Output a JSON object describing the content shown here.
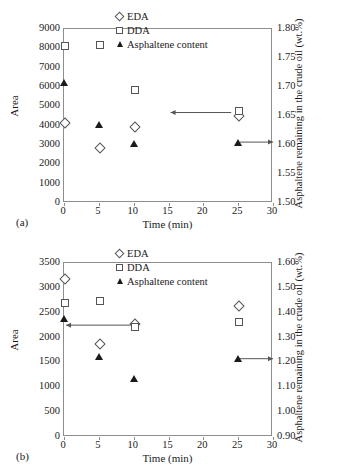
{
  "figure": {
    "panels": [
      {
        "panel_label": "(a)",
        "legend": [
          {
            "symbol": "diamond-open",
            "label": "EDA"
          },
          {
            "symbol": "square-open",
            "label": "DDA"
          },
          {
            "symbol": "triangle-filled",
            "label": "Asphaltene content"
          }
        ]
      },
      {
        "panel_label": "(b)",
        "legend": [
          {
            "symbol": "diamond-open",
            "label": "EDA"
          },
          {
            "symbol": "square-open",
            "label": "DDA"
          },
          {
            "symbol": "triangle-filled",
            "label": "Asphaltene content"
          }
        ]
      }
    ]
  },
  "chart_data": [
    {
      "type": "scatter",
      "panel": "(a)",
      "title": "",
      "xlabel": "Time (min)",
      "ylabel": "Area",
      "y2label": "Asphaltene remaining in the crude oil (wt.%)",
      "xlim": [
        0,
        30
      ],
      "xticks": [
        0,
        5,
        10,
        15,
        20,
        25,
        30
      ],
      "ylim": [
        0,
        9000
      ],
      "yticks": [
        0,
        1000,
        2000,
        3000,
        4000,
        5000,
        6000,
        7000,
        8000,
        9000
      ],
      "y2lim": [
        1.5,
        1.8
      ],
      "y2ticks": [
        "1.50",
        "1.55",
        "1.60",
        "1.65",
        "1.70",
        "1.75",
        "1.80"
      ],
      "grid": false,
      "legend_position": "upper-center",
      "x": [
        0,
        5,
        10,
        25
      ],
      "series": [
        {
          "name": "EDA",
          "axis": "left",
          "marker": "diamond-open",
          "values": [
            4200,
            2900,
            3980,
            4550
          ]
        },
        {
          "name": "DDA",
          "axis": "left",
          "marker": "square-open",
          "values": [
            8150,
            8250,
            5900,
            4800
          ]
        },
        {
          "name": "Asphaltene content",
          "axis": "right",
          "marker": "triangle-filled",
          "values": [
            1.707,
            1.635,
            1.602,
            1.605
          ]
        }
      ],
      "annotations": [
        {
          "type": "arrow",
          "points_to": "left-axis",
          "x_from": 24,
          "x_to": 15.3,
          "y_left": 4680
        },
        {
          "type": "arrow",
          "points_to": "right-axis",
          "x_from": 25.2,
          "x_to": 30,
          "y_right": 1.605
        }
      ]
    },
    {
      "type": "scatter",
      "panel": "(b)",
      "title": "",
      "xlabel": "Time (min)",
      "ylabel": "Area",
      "y2label": "Asphaltene remaining in the crude oil (wt.%)",
      "xlim": [
        0,
        30
      ],
      "xticks": [
        0,
        5,
        10,
        15,
        20,
        25,
        30
      ],
      "ylim": [
        0,
        3500
      ],
      "yticks": [
        0,
        500,
        1000,
        1500,
        2000,
        2500,
        3000,
        3500
      ],
      "y2lim": [
        0.9,
        1.6
      ],
      "y2ticks": [
        "0.90",
        "1.00",
        "1.10",
        "1.20",
        "1.30",
        "1.40",
        "1.50",
        "1.60"
      ],
      "grid": false,
      "legend_position": "upper-center",
      "x": [
        0,
        5,
        10,
        25
      ],
      "series": [
        {
          "name": "EDA",
          "axis": "left",
          "marker": "diamond-open",
          "values": [
            3200,
            1890,
            2300,
            2650
          ]
        },
        {
          "name": "DDA",
          "axis": "left",
          "marker": "square-open",
          "values": [
            2720,
            2760,
            2230,
            2340
          ]
        },
        {
          "name": "Asphaltene content",
          "axis": "right",
          "marker": "triangle-filled",
          "values": [
            1.375,
            1.225,
            1.135,
            1.215
          ]
        }
      ],
      "annotations": [
        {
          "type": "arrow",
          "points_to": "left-axis",
          "x_from": 9.6,
          "x_to": 0.3,
          "y_left": 2250
        },
        {
          "type": "arrow",
          "points_to": "right-axis",
          "x_from": 25.2,
          "x_to": 30,
          "y_right": 1.215
        }
      ]
    }
  ]
}
